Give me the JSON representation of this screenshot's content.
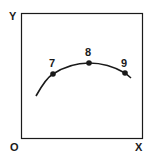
{
  "diagram": {
    "axes": {
      "origin_label": "O",
      "x_label": "X",
      "y_label": "Y"
    },
    "points": [
      {
        "label": "7"
      },
      {
        "label": "8"
      },
      {
        "label": "9"
      }
    ],
    "colors": {
      "line": "#1a1a1a",
      "background": "#ffffff"
    }
  }
}
